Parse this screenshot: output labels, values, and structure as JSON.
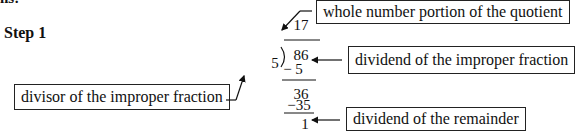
{
  "header": {
    "cut_text": "ns:",
    "step_label": "Step 1"
  },
  "division": {
    "quotient": "17",
    "divisor": "5",
    "dividend": "86",
    "first_subtraction": "− 5",
    "partial_dividend": "36",
    "second_subtraction": "−35",
    "remainder": "1"
  },
  "labels": {
    "quotient_label": "whole number portion of the quotient",
    "dividend_label": "dividend of the improper fraction",
    "divisor_label": "divisor of the improper fraction",
    "remainder_label": "dividend of the remainder"
  }
}
